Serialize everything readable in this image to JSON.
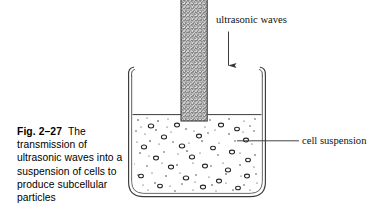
{
  "figure": {
    "caption": {
      "label": "Fig. 2–27",
      "text": "The transmission of ultrasonic waves into a suspension of cells to produce subcellular particles",
      "lines": [
        "The",
        "transmission of",
        "ultrasonic waves into",
        "a suspension of cells",
        "to produce",
        "subcellular particles"
      ]
    },
    "annotations": [
      {
        "id": "ultrasonic-waves",
        "text": "ultrasonic waves"
      },
      {
        "id": "cell-suspension",
        "text": "cell suspension"
      }
    ],
    "parts": {
      "probe": "ultrasonic probe horn",
      "beaker": "glass beaker",
      "liquid": "cell suspension liquid",
      "arrow": "downward direction arrow"
    },
    "colors": {
      "ink": "#000000",
      "glass_outline": "#3a3a3a",
      "probe_fill": "#8e8e8e",
      "probe_outline": "#444444",
      "liquid_fill": "#ffffff",
      "particle": "#2b2b2b",
      "background": "#ffffff"
    }
  }
}
